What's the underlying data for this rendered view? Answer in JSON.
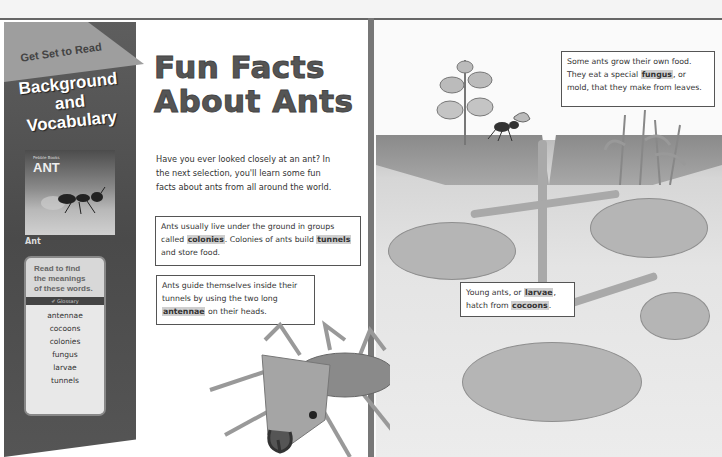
{
  "sidebar": {
    "banner": "Get Set to Read",
    "title_lines": [
      "Background",
      "and",
      "Vocabulary"
    ],
    "cover": {
      "subtitle": "Pebble Books",
      "title": "ANT",
      "caption": "Ant"
    },
    "vocab_card": {
      "prompt_lines": [
        "Read to find",
        "the meanings",
        "of these words."
      ],
      "glossary_label": "Glossary",
      "words": [
        "antennae",
        "cocoons",
        "colonies",
        "fungus",
        "larvae",
        "tunnels"
      ]
    }
  },
  "main": {
    "headline_lines": [
      "Fun Facts",
      "About Ants"
    ],
    "intro": "Have you ever looked closely at an ant? In the next selection, you'll learn some fun facts about ants from all around the world.",
    "facts": [
      {
        "before": "Ants usually live under the ground in groups called ",
        "term": "colonies",
        "middle": ". Colonies of ants build ",
        "term2": "tunnels",
        "after": " and store food."
      },
      {
        "before": "Ants guide themselves inside their tunnels by using the two long ",
        "term": "antennae",
        "after": " on their heads."
      },
      {
        "before": "Some ants grow their own food. They eat a special ",
        "term": "fungus",
        "after": ", or mold, that they make from leaves."
      },
      {
        "before": "Young ants, or ",
        "term": "larvae",
        "middle": ", hatch from ",
        "term2": "cocoons",
        "after": "."
      }
    ]
  },
  "illustration": {
    "description": "ant-colony-cross-section",
    "colors": {
      "soil": "#a8a8a8",
      "tunnel": "#a9a9a9",
      "page": "#ffffff",
      "sidebar": "#555555"
    }
  }
}
